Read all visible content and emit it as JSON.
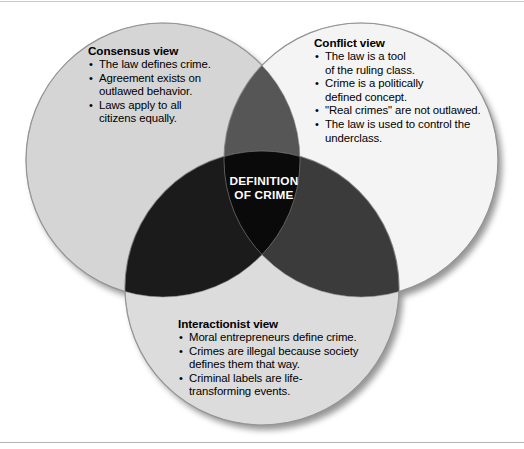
{
  "figure": {
    "name": "definition-of-crime-venn-diagram",
    "center_label": {
      "line1": "DEFINITION",
      "line2": "OF CRIME"
    },
    "circles": [
      {
        "id": "consensus",
        "heading": "Consensus view",
        "fill": "#d5d5d5",
        "stroke": "#9a9a9a",
        "cx": 163,
        "cy": 160,
        "r": 137,
        "items": [
          "The law defines crime.",
          "Agreement exists on outlawed behavior.",
          "Laws apply to all citizens equally."
        ],
        "item_lines": [
          [
            "The law defines crime."
          ],
          [
            "Agreement exists on",
            "outlawed behavior."
          ],
          [
            "Laws apply to all",
            "citizens equally."
          ]
        ]
      },
      {
        "id": "conflict",
        "heading": "Conflict view",
        "fill": "#f4f4f4",
        "stroke": "#9a9a9a",
        "cx": 361,
        "cy": 160,
        "r": 137,
        "items": [
          "The law is a tool of the ruling class.",
          "Crime is a politically defined concept.",
          "\"Real crimes\" are not outlawed.",
          "The law is used to control the underclass."
        ],
        "item_lines": [
          [
            "The law is a tool",
            "of the ruling class."
          ],
          [
            "Crime is a politically",
            "defined concept."
          ],
          [
            "\"Real crimes\" are not outlawed."
          ],
          [
            "The law is used to control the",
            "underclass."
          ]
        ]
      },
      {
        "id": "interactionist",
        "heading": "Interactionist view",
        "fill": "#dcdcdc",
        "stroke": "#9a9a9a",
        "cx": 262,
        "cy": 288,
        "r": 137,
        "items": [
          "Moral entrepreneurs define crime.",
          "Crimes are illegal because society defines them that way.",
          "Criminal labels are life-transforming events."
        ],
        "item_lines": [
          [
            "Moral entrepreneurs define crime."
          ],
          [
            "Crimes are illegal because society",
            "defines them that way."
          ],
          [
            "Criminal labels are life-",
            "transforming events."
          ]
        ]
      }
    ],
    "overlaps": {
      "consensus_conflict": "#565656",
      "consensus_interactionist": "#1b1b1b",
      "conflict_interactionist": "#3b3b3b",
      "triple": "#0a0a0a"
    },
    "bullet_glyph": "•"
  }
}
